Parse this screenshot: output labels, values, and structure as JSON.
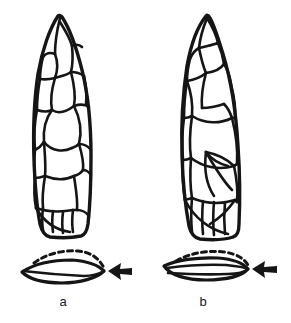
{
  "figure": {
    "kind": "archaeological-lithic-illustration",
    "background_color": "#ffffff",
    "ink_color": "#151515",
    "label_color": "#1a1a1a",
    "specimens": [
      {
        "id": "a",
        "label": "a",
        "view": "face",
        "cross_section": "biconvex-lenticular",
        "cross_section_dashed_edge": "upper",
        "arrow_direction": "left"
      },
      {
        "id": "b",
        "label": "b",
        "view": "face",
        "cross_section": "plano-convex-flattened",
        "cross_section_dashed_edge": "upper",
        "arrow_direction": "left"
      }
    ],
    "labels": {
      "a": "a",
      "b": "b"
    },
    "icons": {
      "arrow_a": "arrow-left-icon",
      "arrow_b": "arrow-left-icon"
    }
  }
}
